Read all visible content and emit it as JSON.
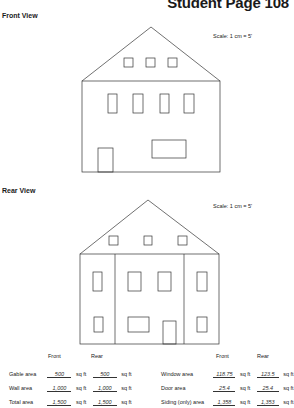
{
  "header": {
    "page_title": "Student Page 108"
  },
  "front_view": {
    "title": "Front View",
    "scale": "Scale: 1 cm = 5'"
  },
  "rear_view": {
    "title": "Rear View",
    "scale": "Scale: 1 cm = 5'"
  },
  "table": {
    "col_front": "Front",
    "col_rear": "Rear",
    "unit": "sq ft",
    "left_rows": [
      {
        "label": "Gable area",
        "front": "500",
        "rear": "500"
      },
      {
        "label": "Wall area",
        "front": "1,000",
        "rear": "1,000"
      },
      {
        "label": "Total area",
        "front": "1,500",
        "rear": "1,500"
      }
    ],
    "right_rows": [
      {
        "label": "Window area",
        "front": "118.75",
        "rear": "123.5"
      },
      {
        "label": "Door area",
        "front": "25.4",
        "rear": "25.4"
      },
      {
        "label": "Siding (only) area",
        "front": "1,358",
        "rear": "1,353"
      }
    ]
  }
}
